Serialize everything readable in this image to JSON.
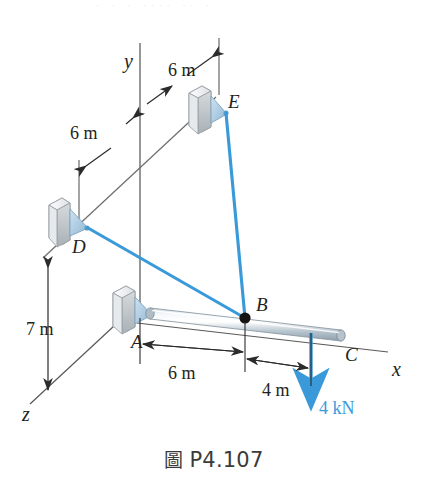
{
  "figure": {
    "caption_cjk": "圖",
    "caption_label": "P4.107",
    "top_artifact": "· ·  ·  ····  ··  ·",
    "accent_color": "#3a9ad9",
    "ink_color": "#231f20"
  },
  "axes": [
    {
      "name": "y-axis",
      "label": "y"
    },
    {
      "name": "x-axis",
      "label": "x"
    },
    {
      "name": "z-axis",
      "label": "z"
    }
  ],
  "points": [
    {
      "id": "A",
      "label": "A",
      "role": "wall-support"
    },
    {
      "id": "B",
      "label": "B",
      "role": "cable-junction"
    },
    {
      "id": "C",
      "label": "C",
      "role": "rod-free-end"
    },
    {
      "id": "D",
      "label": "D",
      "role": "wall-anchor"
    },
    {
      "id": "E",
      "label": "E",
      "role": "wall-anchor"
    }
  ],
  "dimensions": [
    {
      "id": "dim-6m-upper",
      "value": "6 m",
      "between": "y-axis to E plane"
    },
    {
      "id": "dim-6m-left",
      "value": "6 m",
      "between": "D plane to y-axis"
    },
    {
      "id": "dim-7m",
      "value": "7 m",
      "between": "D level to z-axis"
    },
    {
      "id": "dim-6m-ab",
      "value": "6 m",
      "between": "A to B"
    },
    {
      "id": "dim-4m-bc",
      "value": "4 m",
      "between": "B to C"
    }
  ],
  "load": {
    "label": "4 kN",
    "direction": "down",
    "applied_at": "C",
    "color": "#3a9ad9"
  },
  "members": [
    {
      "id": "rod-AC",
      "kind": "rod",
      "from": "A",
      "to": "C"
    },
    {
      "id": "cable-BD",
      "kind": "cable",
      "from": "B",
      "to": "D"
    },
    {
      "id": "cable-BE",
      "kind": "cable",
      "from": "B",
      "to": "E"
    }
  ]
}
